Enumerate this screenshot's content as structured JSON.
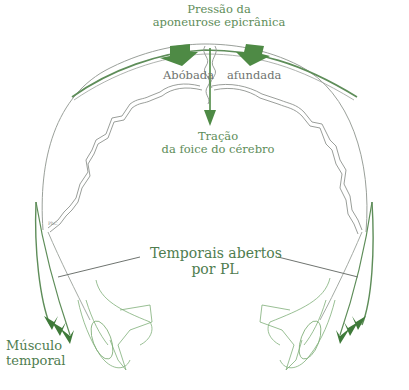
{
  "diagram": {
    "labels": {
      "pressure": {
        "line1": "Pressão da",
        "line2": "aponeurose epicrânica"
      },
      "vault_left": "Abóbada",
      "vault_right": "afundada",
      "traction": {
        "line1": "Tração",
        "line2": "da foice do cérebro"
      },
      "temporals": {
        "line1": "Temporais abertos",
        "line2": "por PL"
      },
      "muscle": {
        "line1": "Músculo",
        "line2": "temporal"
      },
      "small_mark": "PhC"
    },
    "colors": {
      "arrow_green": "#4e8a45",
      "label_green": "#5e8d59",
      "outline_grey": "#9aa09a",
      "line_green": "#7fae78"
    },
    "icons": {
      "pressure_arrows": "down-arrow-icon",
      "falx_arrow": "down-arrow-icon",
      "muscle_arrows": "chevron-arrow-icon"
    }
  }
}
